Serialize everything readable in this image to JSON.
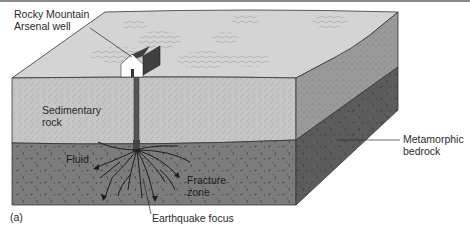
{
  "figure": {
    "panel_label": "(a)",
    "labels": {
      "well": [
        "Rocky Mountain",
        "Arsenal well"
      ],
      "sedimentary": [
        "Sedimentary",
        "rock"
      ],
      "fluid": "Fluid",
      "fracture": [
        "Fracture",
        "zone"
      ],
      "focus": "Earthquake focus",
      "bedrock": [
        "Metamorphic",
        "bedrock"
      ]
    },
    "colors": {
      "surface": "#d4d4d4",
      "sediment_front": "#c6c6c6",
      "sediment_side": "#9a9a9a",
      "bedrock_front": "#7c7c7c",
      "bedrock_side": "#5c5c5c",
      "house_wall": "#ffffff",
      "house_roof": "#3f3f3f",
      "well_pipe": "#555555",
      "fractures": "#1e1e1e",
      "leader_lines": "#2a2a2a"
    }
  }
}
